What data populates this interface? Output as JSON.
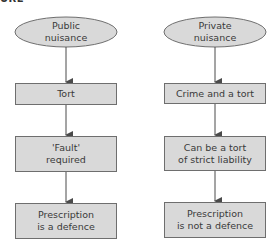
{
  "figure": {
    "cropped_heading_fragment": "URE",
    "colors": {
      "node_fill": "#d9d9d9",
      "node_stroke": "#6e6e6e",
      "arrow": "#4a4a4a",
      "text": "#3a3a3a"
    },
    "columns": [
      {
        "id": "public",
        "root": "Public\nnuisance",
        "steps": [
          "Tort",
          "'Fault'\nrequired",
          "Prescription\nis a defence"
        ]
      },
      {
        "id": "private",
        "root": "Private\nnuisance",
        "steps": [
          "Crime and a tort",
          "Can be a tort\nof strict liability",
          "Prescription\nis not a defence"
        ]
      }
    ]
  }
}
